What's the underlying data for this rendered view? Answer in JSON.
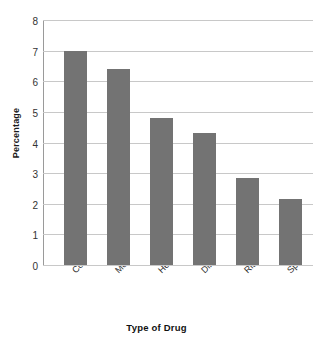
{
  "chart_data": {
    "type": "bar",
    "title": "",
    "xlabel": "Type of Drug",
    "ylabel": "Percentage",
    "categories": [
      "Cocaine",
      "Morphine",
      "Heroin",
      "Dilaudid",
      "Ritalin",
      "Speedball"
    ],
    "values": [
      7.0,
      6.4,
      4.8,
      4.3,
      2.85,
      2.15
    ],
    "ylim": [
      0,
      8
    ],
    "yticks": [
      "0",
      "1",
      "2",
      "3",
      "4",
      "5",
      "6",
      "7",
      "8"
    ],
    "grid": "horizontal",
    "legend": "none",
    "bar_color": "#737373",
    "gridline_color": "#c8c8c8",
    "axis_color": "#9a9a9a",
    "background_color": "#ffffff"
  },
  "top_edge_artifacts": [
    "",
    "",
    "",
    ""
  ]
}
